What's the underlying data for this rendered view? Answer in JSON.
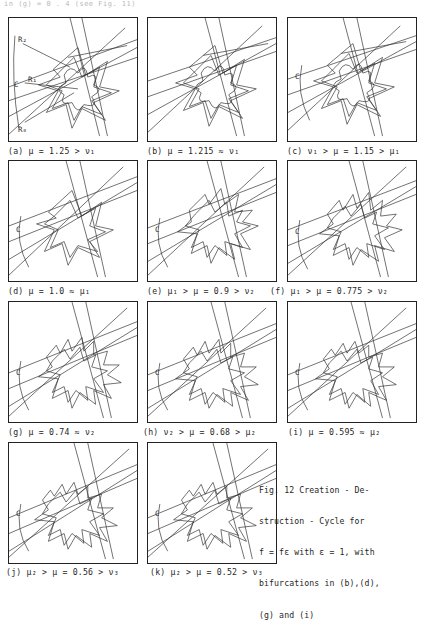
{
  "page": {
    "top_partial_text": "in (g)   = 0 . 4 (see Fig.  11)",
    "background_color": "#ffffff",
    "ink_color": "#1f1f1f"
  },
  "figure_caption": {
    "lines": [
      "Fig. 12  Creation - De-",
      "struction - Cycle for",
      "f = fε  with  ε = 1, with",
      "bifurcations in (b),(d),",
      "(g) and (i)"
    ],
    "number": "Fig. 12",
    "title": "Creation - Destruction - Cycle",
    "parameter": "f = fε with ε = 1",
    "bifurcation_panels": "(b),(d),(g) and (i)"
  },
  "panels": [
    {
      "id": "a",
      "caption": "(a) μ = 1.25 > ν₁",
      "mu": 1.25,
      "relation": "μ > ν₁",
      "inner_labels": [
        {
          "text": "R₂",
          "x": 9,
          "y": 22
        },
        {
          "text": "C",
          "x": 6,
          "y": 68
        },
        {
          "text": "R₁",
          "x": 20,
          "y": 62
        },
        {
          "text": "R₀",
          "x": 9,
          "y": 112
        }
      ]
    },
    {
      "id": "b",
      "caption": "(b) μ = 1.215 ≈ ν₁",
      "mu": 1.215,
      "relation": "μ ≈ ν₁",
      "inner_labels": []
    },
    {
      "id": "c",
      "caption": "(c) ν₁ > μ = 1.15 > μ₁",
      "mu": 1.15,
      "relation": "ν₁ > μ > μ₁",
      "inner_labels": [
        {
          "text": "C",
          "x": 8,
          "y": 60
        }
      ]
    },
    {
      "id": "d",
      "caption": "(d) μ = 1.0 ≈ μ₁",
      "mu": 1.0,
      "relation": "μ ≈ μ₁",
      "inner_labels": [
        {
          "text": "C",
          "x": 8,
          "y": 70
        }
      ]
    },
    {
      "id": "e",
      "caption": "(e) μ₁ > μ = 0.9 > ν₂",
      "mu": 0.9,
      "relation": "μ₁ > μ > ν₂",
      "inner_labels": [
        {
          "text": "C",
          "x": 8,
          "y": 70
        }
      ]
    },
    {
      "id": "f",
      "caption": "(f) μ₁ > μ =  0.775 > ν₂",
      "mu": 0.775,
      "relation": "μ₁ > μ > ν₂",
      "inner_labels": [
        {
          "text": "C",
          "x": 8,
          "y": 72
        }
      ]
    },
    {
      "id": "g",
      "caption": "(g) μ = 0.74 ≈ ν₂",
      "mu": 0.74,
      "relation": "μ ≈ ν₂",
      "inner_labels": [
        {
          "text": "C",
          "x": 8,
          "y": 72
        }
      ]
    },
    {
      "id": "h",
      "caption": "(h) ν₂ > μ = 0.68 > μ₂",
      "mu": 0.68,
      "relation": "ν₂ > μ > μ₂",
      "inner_labels": [
        {
          "text": "C",
          "x": 8,
          "y": 72
        }
      ]
    },
    {
      "id": "i",
      "caption": "(i) μ = 0.595  ≈  μ₂",
      "mu": 0.595,
      "relation": "μ ≈ μ₂",
      "inner_labels": [
        {
          "text": "C",
          "x": 8,
          "y": 72
        }
      ]
    },
    {
      "id": "j",
      "caption": "(j) μ₂ > μ = 0.56 > ν₃",
      "mu": 0.56,
      "relation": "μ₂ > μ > ν₃",
      "inner_labels": [
        {
          "text": "C",
          "x": 8,
          "y": 72
        }
      ]
    },
    {
      "id": "k",
      "caption": "(k) μ₂ > μ = 0.52 > ν₃",
      "mu": 0.52,
      "relation": "μ₂ > μ > ν₃",
      "inner_labels": [
        {
          "text": "C",
          "x": 8,
          "y": 72
        }
      ]
    }
  ]
}
